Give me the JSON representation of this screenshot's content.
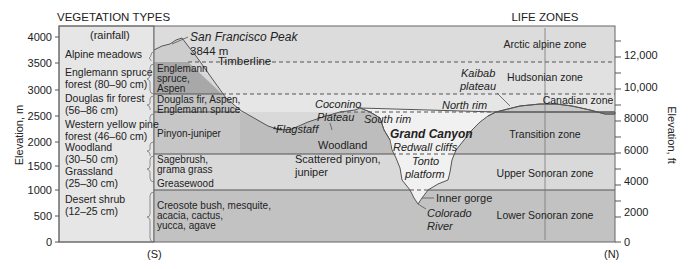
{
  "headers": {
    "vegetation_types": "VEGETATION TYPES",
    "rainfall": "(rainfall)",
    "life_zones": "LIFE ZONES"
  },
  "axes": {
    "left_label": "Elevation, m",
    "left_ticks": [
      "4000",
      "3500",
      "3000",
      "2500",
      "2000",
      "1500",
      "1000",
      "500",
      "0"
    ],
    "right_label": "Elevation, ft",
    "right_ticks": [
      "12,000",
      "10,000",
      "8000",
      "6000",
      "4000",
      "2000",
      "0"
    ],
    "south_marker": "(S)",
    "north_marker": "(N)"
  },
  "vegetation_types": [
    {
      "line1": "Alpine meadows",
      "line2": ""
    },
    {
      "line1": "Englemann spruce",
      "line2": "forest (80–90 cm)"
    },
    {
      "line1": "Douglas fir forest",
      "line2": "(56–86 cm)"
    },
    {
      "line1": "Western yellow pine",
      "line2": "forest (46–60 cm)"
    },
    {
      "line1": "Woodland",
      "line2": "(30–50 cm)"
    },
    {
      "line1": "Grassland",
      "line2": "(25–30 cm)"
    },
    {
      "line1": "Desert shrub",
      "line2": "(12–25 cm)"
    }
  ],
  "plant_bands": {
    "englemann": [
      "Englemann",
      "spruce,",
      "Aspen"
    ],
    "douglas": [
      "Douglas fir, Aspen,",
      "Englemann spruce"
    ],
    "pinyon": "Pinyon-juniper",
    "sagebrush": [
      "Sagebrush,",
      "grama grass"
    ],
    "greasewood": "Greasewood",
    "creosote": [
      "Creosote bush, mesquite,",
      "acacia, cactus,",
      "yucca, agave"
    ]
  },
  "landmarks": {
    "peak_name": "San Francisco Peak",
    "peak_elev": "3844 m",
    "timberline": "Timberline",
    "coconino": [
      "Coconino",
      "Plateau"
    ],
    "flagstaff": "Flagstaff",
    "south_rim": "South rim",
    "woodland": "Woodland",
    "scattered": [
      "Scattered pinyon,",
      "juniper"
    ],
    "grand_canyon": "Grand Canyon",
    "redwall": "Redwall cliffs",
    "tonto": [
      "Tonto",
      "platform"
    ],
    "inner_gorge": "Inner gorge",
    "colorado": [
      "Colorado",
      "River"
    ],
    "kaibab": [
      "Kaibab",
      "plateau"
    ],
    "north_rim": "North rim"
  },
  "life_zones": [
    "Arctic alpine zone",
    "Hudsonian zone",
    "Canadian zone",
    "Transition zone",
    "Upper Sonoran zone",
    "Lower Sonoran zone"
  ],
  "colors": {
    "band_light": "#e4e4e4",
    "band_mid": "#cfcfcf",
    "band_dark": "#b8b8b8",
    "terrain_dark": "#a9a9a9",
    "canyon_fill": "#eeeeee",
    "line": "#555555"
  }
}
